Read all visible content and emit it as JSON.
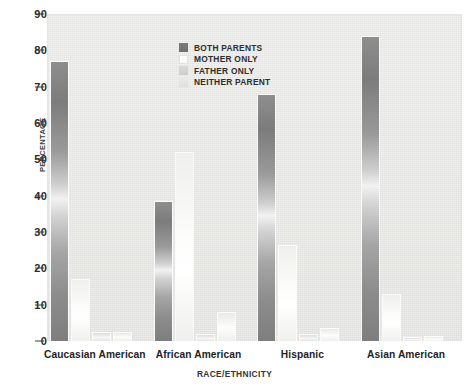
{
  "chart_data": {
    "type": "bar",
    "title": "",
    "xlabel": "RACE/ETHNICITY",
    "ylabel": "PERCENTAGE",
    "ylim": [
      0,
      90
    ],
    "yticks": [
      0,
      10,
      20,
      30,
      40,
      50,
      60,
      70,
      80,
      90
    ],
    "grid": false,
    "legend_position": "top-center",
    "categories": [
      "Caucasian American",
      "African American",
      "Hispanic",
      "Asian American"
    ],
    "series": [
      {
        "name": "BOTH PARENTS",
        "color": "#7d7d7d",
        "values": [
          77,
          38.5,
          68,
          84
        ]
      },
      {
        "name": "MOTHER ONLY",
        "color": "#fbfbfa",
        "values": [
          17,
          52,
          26.5,
          13
        ]
      },
      {
        "name": "FATHER ONLY",
        "color": "#d4d4d4",
        "values": [
          2.5,
          2,
          2,
          1
        ]
      },
      {
        "name": "NEITHER PARENT",
        "color": "#e8e8e6",
        "values": [
          2.5,
          8,
          3.5,
          1.5
        ]
      }
    ]
  },
  "axes": {
    "y_title": "PERCENTAGE",
    "x_title": "RACE/ETHNICITY",
    "y_tick_labels": [
      "90",
      "80",
      "70",
      "60",
      "50",
      "40",
      "30",
      "20",
      "10",
      "0"
    ]
  },
  "legend": {
    "items": [
      {
        "label": "BOTH PARENTS"
      },
      {
        "label": "MOTHER ONLY"
      },
      {
        "label": "FATHER ONLY"
      },
      {
        "label": "NEITHER PARENT"
      }
    ]
  },
  "x_categories": [
    {
      "label": "Caucasian American"
    },
    {
      "label": "African American"
    },
    {
      "label": "Hispanic"
    },
    {
      "label": "Asian American"
    }
  ]
}
